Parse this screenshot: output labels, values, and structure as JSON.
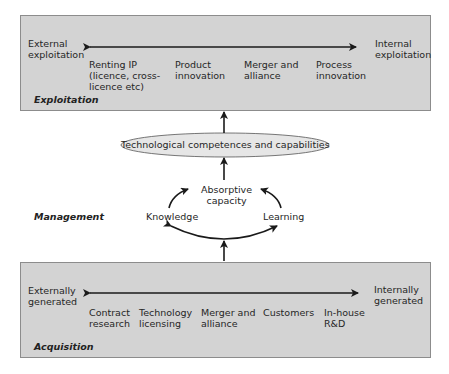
{
  "exploitation": {
    "section_label": "Exploitation",
    "left_end": "External\nexploitation",
    "right_end": "Internal\nexploitation",
    "items": [
      "Renting IP\n(licence, cross-\nlicence etc)",
      "Product\ninnovation",
      "Merger and\nalliance",
      "Process\ninnovation"
    ]
  },
  "middle": {
    "ellipse_label": "Technological competences and capabilities",
    "section_label": "Management",
    "absorptive": "Absorptive\ncapacity",
    "knowledge": "Knowledge",
    "learning": "Learning"
  },
  "acquisition": {
    "section_label": "Acquisition",
    "left_end": "Externally\ngenerated",
    "right_end": "Internally\ngenerated",
    "items": [
      "Contract\nresearch",
      "Technology\nlicensing",
      "Merger and\nalliance",
      "Customers",
      "In-house\nR&D"
    ]
  },
  "colors": {
    "box_fill": "#d3d3d3",
    "box_border": "#8c8c8c",
    "ellipse_fill": "#e6e6e6",
    "arrow": "#1a1a1a"
  }
}
